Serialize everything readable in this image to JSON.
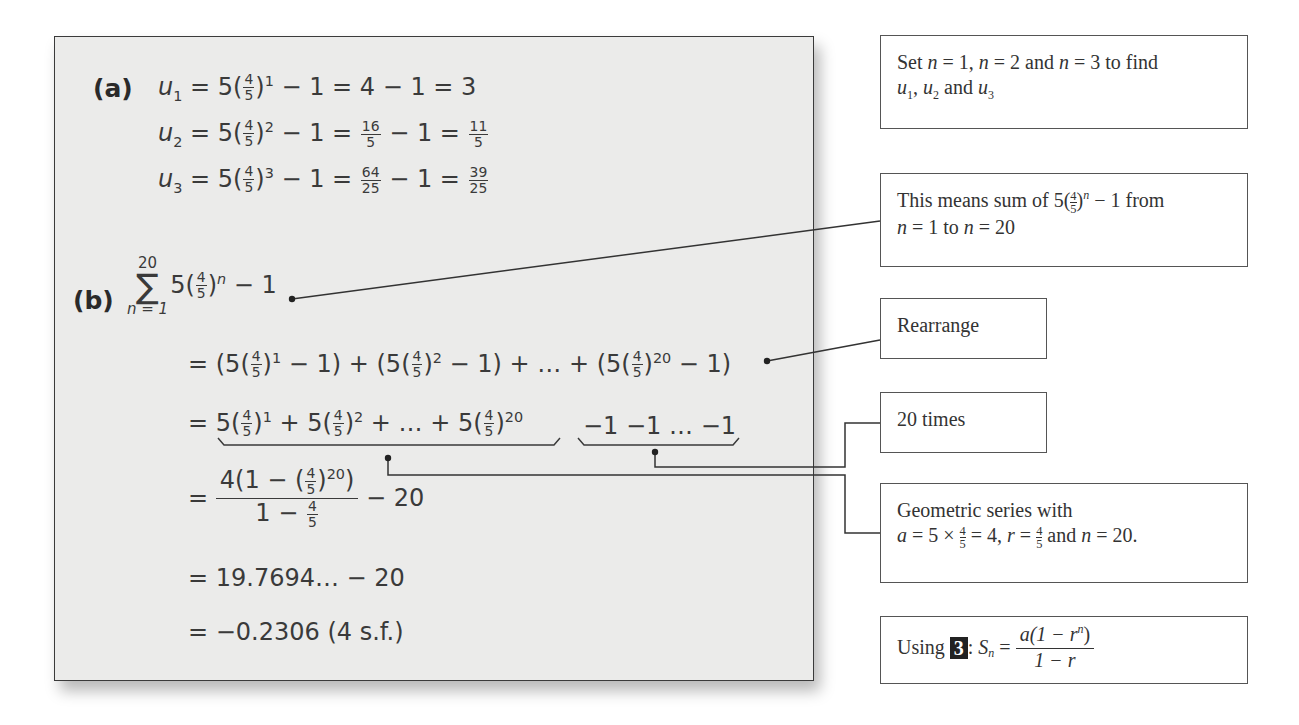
{
  "solution": {
    "part_a": {
      "label": "(a)",
      "lines": [
        {
          "lhs": "u",
          "sub": "1",
          "power": "1",
          "rest1": " − 1 = 4 − 1 = 3"
        },
        {
          "lhs": "u",
          "sub": "2",
          "power": "2",
          "rest1": " − 1 = ",
          "frac1_num": "16",
          "frac1_den": "5",
          "rest2": " − 1 = ",
          "frac2_num": "11",
          "frac2_den": "5"
        },
        {
          "lhs": "u",
          "sub": "3",
          "power": "3",
          "rest1": " − 1 = ",
          "frac1_num": "64",
          "frac1_den": "25",
          "rest2": " − 1 = ",
          "frac2_num": "39",
          "frac2_den": "25"
        }
      ],
      "base_coef": "5",
      "frac_num": "4",
      "frac_den": "5"
    },
    "part_b": {
      "label": "(b)",
      "sigma_upper": "20",
      "sigma_symbol": "∑",
      "sigma_lower": "n = 1",
      "sum_power": "n",
      "sum_rest": " − 1",
      "line1": {
        "eq": "= (5",
        "p1": "1",
        "m1": " − 1) + (5",
        "p2": "2",
        "m2": " − 1) + … + (5",
        "p3": "20",
        "m3": " − 1)"
      },
      "line2": {
        "eq": "= ",
        "t1": "5",
        "p1": "1",
        "t2": " + 5",
        "p2": "2",
        "t3": " + … + 5",
        "p3": "20",
        "ones": "−1 −1 … −1"
      },
      "line3": {
        "eq": "= ",
        "num_a": "4(1 − (",
        "num_pow": "20",
        "num_b": ")",
        "den_a": "1 − ",
        "minus20": " − 20"
      },
      "line4": "= 19.7694… − 20",
      "line5": "= −0.2306 (4 s.f.)"
    }
  },
  "notes": {
    "note1": {
      "t1": "Set ",
      "n": "n",
      "t2": " = 1, ",
      "t3": " = 2 and ",
      "t4": " = 3 to find",
      "u": "u",
      "s1": "1",
      "s2": "2",
      "s3": "3",
      "c1": ", ",
      "and": " and "
    },
    "note2": {
      "t1": "This means sum of 5",
      "num": "4",
      "den": "5",
      "pow": "n",
      "t2": " − 1 from",
      "n": "n",
      "t3": " = 1 to ",
      "t4": " = 20"
    },
    "note3": {
      "text": "Rearrange"
    },
    "note4": {
      "text": "20 times"
    },
    "note5": {
      "line1": "Geometric series with",
      "a": "a",
      "t1": " = 5 × ",
      "t2": " = 4, ",
      "r": "r",
      "t3": " = ",
      "t4": " and ",
      "n": "n",
      "t5": " = 20.",
      "num": "4",
      "den": "5"
    },
    "note6": {
      "t1": "Using ",
      "badge": "3",
      "t2": ": ",
      "S": "S",
      "sub": "n",
      "t3": " = ",
      "num": "a(1 − r",
      "num_pow": "n",
      "num_end": ")",
      "den": "1 − r"
    }
  },
  "colors": {
    "panel_bg": "#ebebea",
    "ink": "#3a3a3a",
    "badge_bg": "#222222"
  }
}
